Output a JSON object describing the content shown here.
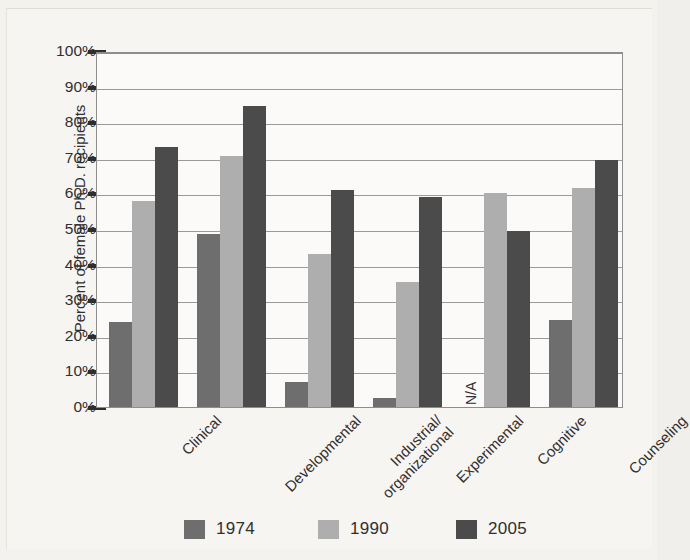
{
  "chart_data": {
    "type": "bar",
    "title": "",
    "xlabel": "",
    "ylabel": "Percent of female Ph.D. recipients",
    "ylim": [
      0,
      100
    ],
    "ytick_labels": [
      "100%",
      "90%",
      "80%",
      "70%",
      "60%",
      "50%",
      "40%",
      "30%",
      "20%",
      "10%",
      "0%"
    ],
    "ytick_values": [
      100,
      90,
      80,
      70,
      60,
      50,
      40,
      30,
      20,
      10,
      0
    ],
    "grid": true,
    "legend_position": "bottom",
    "categories": [
      "Clinical",
      "Developmental",
      "Industrial/\norganizational",
      "Experimental",
      "Cognitive",
      "Counseling"
    ],
    "series": [
      {
        "name": "1974",
        "color": "#6e6e6e",
        "values": [
          24,
          48.5,
          7,
          2.5,
          null,
          24.5
        ]
      },
      {
        "name": "1990",
        "color": "#aeaeae",
        "values": [
          58,
          70.5,
          43,
          35,
          60,
          61.5
        ]
      },
      {
        "name": "2005",
        "color": "#4b4b4b",
        "values": [
          73,
          84.5,
          61,
          59,
          49.5,
          69.5
        ]
      }
    ],
    "annotations": [
      {
        "text": "N/A",
        "category": "Cognitive",
        "series": "1974",
        "rotation": -90
      }
    ]
  },
  "axis": {
    "y_title": "Percent of female Ph.D. recipients",
    "ticks": [
      {
        "label": "100%"
      },
      {
        "label": "90%"
      },
      {
        "label": "80%"
      },
      {
        "label": "70%"
      },
      {
        "label": "60%"
      },
      {
        "label": "50%"
      },
      {
        "label": "40%"
      },
      {
        "label": "30%"
      },
      {
        "label": "20%"
      },
      {
        "label": "10%"
      },
      {
        "label": "0%"
      }
    ]
  },
  "categories": [
    {
      "label": "Clinical",
      "line2": ""
    },
    {
      "label": "Developmental",
      "line2": ""
    },
    {
      "label": "Industrial/",
      "line2": "organizational"
    },
    {
      "label": "Experimental",
      "line2": ""
    },
    {
      "label": "Cognitive",
      "line2": ""
    },
    {
      "label": "Counseling",
      "line2": ""
    }
  ],
  "legend": {
    "items": [
      {
        "label": "1974",
        "color": "#6e6e6e"
      },
      {
        "label": "1990",
        "color": "#aeaeae"
      },
      {
        "label": "2005",
        "color": "#4b4b4b"
      }
    ]
  },
  "annotations": {
    "cognitive_1974": "N/A"
  }
}
